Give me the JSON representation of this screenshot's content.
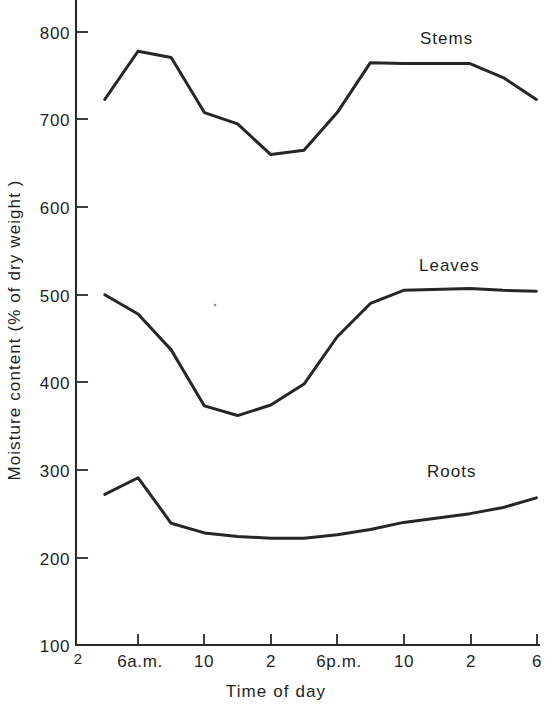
{
  "chart_data": {
    "type": "line",
    "title": "",
    "xlabel": "Time of day",
    "ylabel": "Moisture content (% of dry weight )",
    "x_tick_labels": [
      "2",
      "6a.m.",
      "10",
      "2",
      "6p.m.",
      "10",
      "2",
      "6"
    ],
    "x_tick_hours": [
      2,
      6,
      10,
      14,
      18,
      22,
      26,
      30
    ],
    "y_tick_labels": [
      "100",
      "200",
      "300",
      "400",
      "500",
      "600",
      "700",
      "800"
    ],
    "y_ticks": [
      100,
      200,
      300,
      400,
      500,
      600,
      700,
      800
    ],
    "ylim": [
      100,
      830
    ],
    "xlim": [
      2,
      30
    ],
    "grid": false,
    "legend_position": "inline-right",
    "x": [
      4,
      6,
      8,
      10,
      12,
      14,
      16,
      18,
      20,
      22,
      26,
      28,
      30
    ],
    "series": [
      {
        "name": "Stems",
        "label": "Stems",
        "color": "#262626",
        "values": [
          723,
          778,
          771,
          708,
          695,
          660,
          665,
          708,
          765,
          764,
          764,
          748,
          723
        ],
        "label_x_hour": 22.7,
        "label_value": 805
      },
      {
        "name": "Leaves",
        "label": "Leaves",
        "color": "#262626",
        "values": [
          500,
          478,
          437,
          373,
          362,
          374,
          398,
          452,
          490,
          505,
          507,
          505,
          504
        ],
        "label_x_hour": 22.7,
        "label_value": 545
      },
      {
        "name": "Roots",
        "label": "Roots",
        "color": "#262626",
        "values": [
          272,
          291,
          239,
          228,
          224,
          222,
          222,
          226,
          232,
          240,
          250,
          257,
          268
        ],
        "label_x_hour": 23.0,
        "label_value": 307
      }
    ],
    "origin_corner_label": "2"
  }
}
